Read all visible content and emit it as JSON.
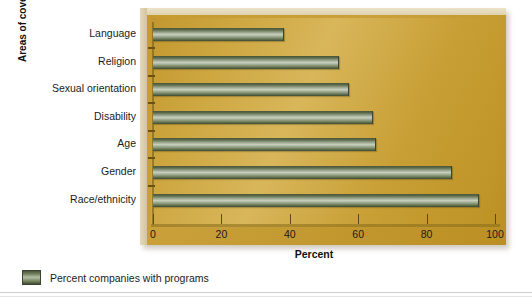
{
  "chart_data": {
    "type": "bar",
    "orientation": "horizontal",
    "title": "",
    "xlabel": "Percent",
    "ylabel": "Areas of coverage",
    "xlim": [
      0,
      100
    ],
    "xticks": [
      0,
      20,
      40,
      60,
      80,
      100
    ],
    "xticklabels": [
      "0",
      "20",
      "40",
      "60",
      "80",
      "100"
    ],
    "grid": false,
    "legend_position": "below-left",
    "categories": [
      "Language",
      "Religion",
      "Sexual orientation",
      "Disability",
      "Age",
      "Gender",
      "Race/ethnicity"
    ],
    "series": [
      {
        "name": "Percent companies with programs",
        "color": "#6d7b58",
        "values": [
          38,
          54,
          57,
          64,
          65,
          87,
          95
        ]
      }
    ]
  },
  "legend": {
    "entries": [
      {
        "label": "Percent companies with programs"
      }
    ]
  },
  "colors": {
    "plate_gold": "#c9a03a",
    "canvas_gold": "#cda63f",
    "bar_green": "#6d7b58",
    "bar_highlight": "#c6cdbc",
    "text": "#1b1b1b"
  }
}
